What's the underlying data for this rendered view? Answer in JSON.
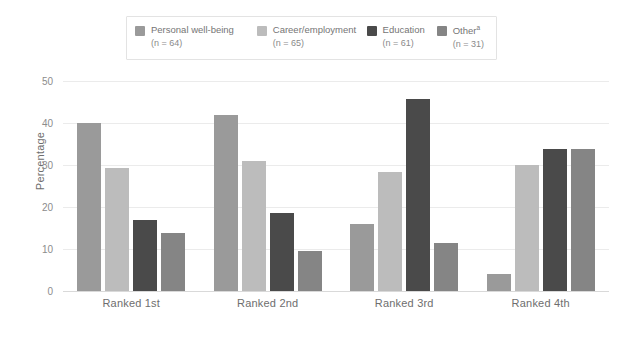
{
  "chart_data": {
    "type": "bar",
    "title": "",
    "xlabel": "",
    "ylabel": "Percentage",
    "ylim": [
      0,
      50
    ],
    "yticks": [
      0,
      10,
      20,
      30,
      40,
      50
    ],
    "grid": true,
    "legend_position": "top",
    "categories": [
      "Ranked 1st",
      "Ranked 2nd",
      "Ranked 3rd",
      "Ranked 4th"
    ],
    "series": [
      {
        "name": "Personal well-being",
        "n_label": "(n = 64)",
        "n": 64,
        "color": "#9a9a9a",
        "values": [
          40.0,
          41.8,
          15.9,
          4.0
        ]
      },
      {
        "name": "Career/employment",
        "n_label": "(n = 65)",
        "n": 65,
        "color": "#bcbcbc",
        "values": [
          29.4,
          30.9,
          28.4,
          30.0
        ]
      },
      {
        "name": "Education",
        "n_label": "(n = 61)",
        "n": 61,
        "color": "#4a4a4a",
        "values": [
          17.0,
          18.5,
          45.8,
          33.7
        ]
      },
      {
        "name": "Other",
        "name_superscript": "a",
        "n_label": "(n = 31)",
        "n": 31,
        "color": "#858585",
        "values": [
          13.9,
          9.5,
          11.4,
          33.7
        ]
      }
    ]
  }
}
